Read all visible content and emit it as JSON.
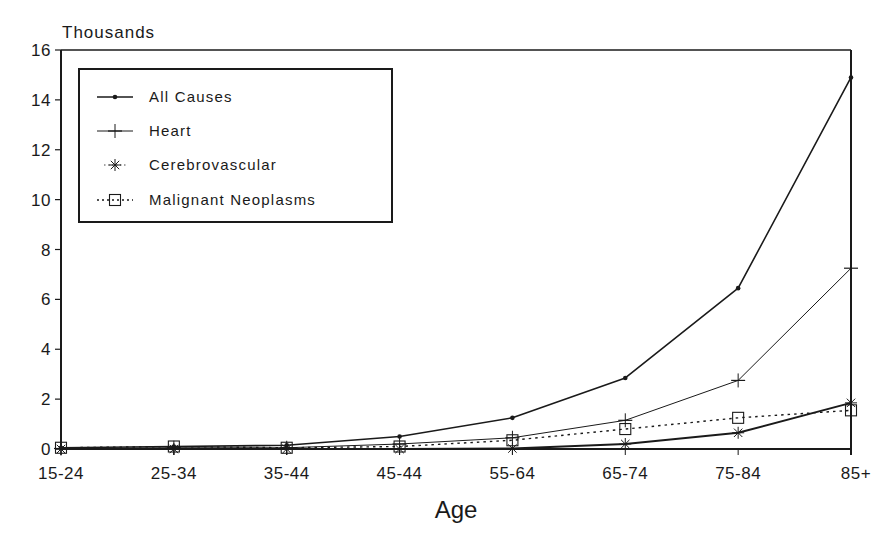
{
  "chart_data": {
    "type": "line",
    "title": "",
    "xlabel": "Age",
    "ylabel": "Thousands",
    "ylim": [
      0,
      16
    ],
    "yticks": [
      0,
      2,
      4,
      6,
      8,
      10,
      12,
      14,
      16
    ],
    "grid": false,
    "legend_position": "upper-left (inside plot, boxed)",
    "categories": [
      "15-24",
      "25-34",
      "35-44",
      "45-44",
      "55-64",
      "65-74",
      "75-84",
      "85+"
    ],
    "series": [
      {
        "name": "All Causes",
        "marker": "dot",
        "style": "solid",
        "width": 1.6,
        "values": [
          0.05,
          0.1,
          0.15,
          0.5,
          1.25,
          2.85,
          6.45,
          14.9
        ]
      },
      {
        "name": "Heart",
        "marker": "plus",
        "style": "solid",
        "width": 1.0,
        "values": [
          0.02,
          0.05,
          0.05,
          0.2,
          0.45,
          1.15,
          2.75,
          7.25
        ]
      },
      {
        "name": "Cerebrovascular",
        "marker": "asterisk",
        "style": "solid",
        "width": 2.0,
        "values": [
          0.0,
          0.0,
          0.0,
          0.0,
          0.02,
          0.2,
          0.65,
          1.85
        ]
      },
      {
        "name": "Malignant Neoplasms",
        "marker": "square",
        "style": "dotted",
        "width": 1.4,
        "values": [
          0.05,
          0.1,
          0.05,
          0.1,
          0.35,
          0.8,
          1.25,
          1.55
        ]
      }
    ]
  },
  "labels": {
    "y_unit": "Thousands",
    "x_axis": "Age"
  },
  "colors": {
    "ink": "#1a1a1a",
    "background": "#ffffff"
  }
}
